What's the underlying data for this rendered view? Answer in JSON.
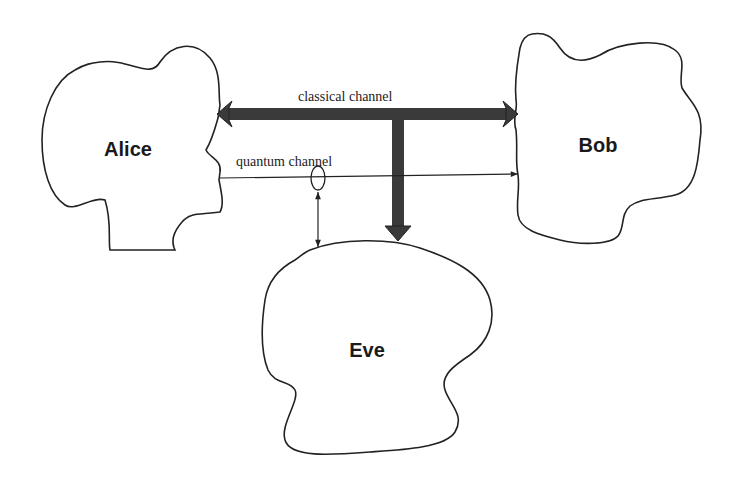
{
  "diagram": {
    "nodes": [
      {
        "id": "alice",
        "label": "Alice"
      },
      {
        "id": "bob",
        "label": "Bob"
      },
      {
        "id": "eve",
        "label": "Eve"
      }
    ],
    "edges": [
      {
        "id": "classical",
        "label": "classical channel",
        "from": "alice",
        "to": "bob",
        "style": "thick-bidirectional",
        "tap": "eve"
      },
      {
        "id": "quantum",
        "label": "quantum channel",
        "from": "alice",
        "to": "bob",
        "style": "thin-directed",
        "tap": "eve"
      }
    ],
    "colors": {
      "stroke": "#222222",
      "thick_arrow": "#3a3a3a",
      "background": "#ffffff"
    }
  }
}
